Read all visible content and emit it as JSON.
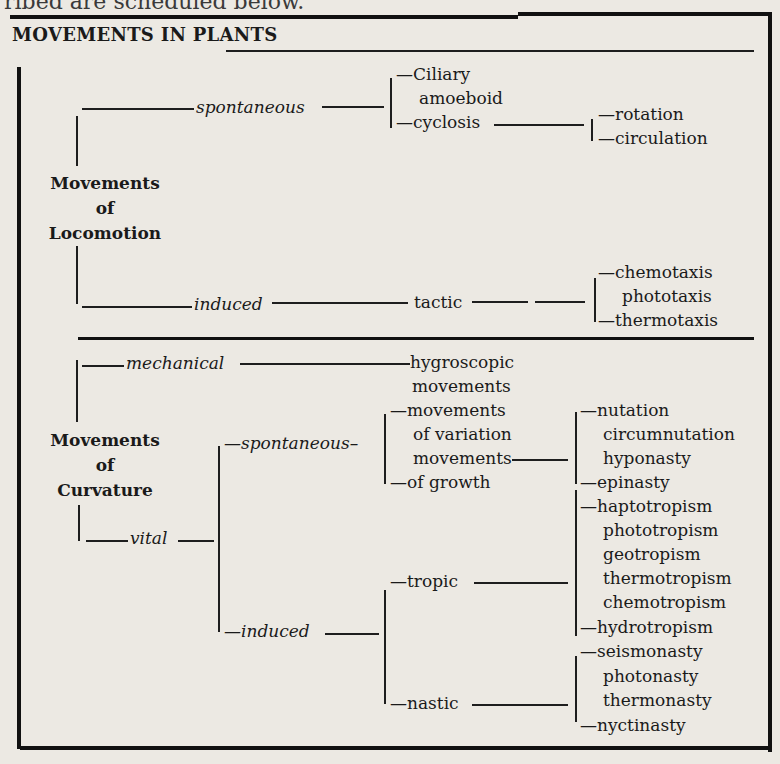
{
  "page": {
    "preceding_text_fragment": "ribed are scheduled below."
  },
  "diagram": {
    "title": "MOVEMENTS IN PLANTS",
    "locomotion": {
      "label_lines": [
        "Movements",
        "of",
        "Locomotion"
      ],
      "spontaneous": {
        "label": "spontaneous",
        "children": [
          "Ciliary",
          "amoeboid",
          "cyclosis"
        ],
        "cyclosis_children": [
          "rotation",
          "circulation"
        ]
      },
      "induced": {
        "label": "induced",
        "tactic_label": "tactic",
        "tactic_children": [
          "chemotaxis",
          "phototaxis",
          "thermotaxis"
        ]
      }
    },
    "curvature": {
      "label_lines": [
        "Movements",
        "of",
        "Curvature"
      ],
      "mechanical": {
        "label": "mechanical",
        "child_lines": [
          "hygroscopic",
          "movements"
        ]
      },
      "vital": {
        "label": "vital",
        "spontaneous": {
          "label": "spontaneous",
          "child_lines": [
            "movements",
            "of variation",
            "movements",
            "of growth"
          ],
          "growth_children": [
            "nutation",
            "circumnutation",
            "hyponasty",
            "epinasty"
          ]
        },
        "induced": {
          "label": "induced",
          "tropic": {
            "label": "tropic",
            "children": [
              "haptotropism",
              "phototropism",
              "geotropism",
              "thermotropism",
              "chemotropism",
              "hydrotropism"
            ]
          },
          "nastic": {
            "label": "nastic",
            "children": [
              "seismonasty",
              "photonasty",
              "thermonasty",
              "nyctinasty"
            ]
          }
        }
      }
    }
  }
}
